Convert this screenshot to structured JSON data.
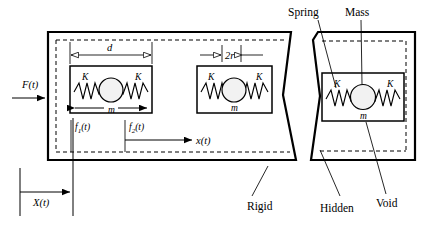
{
  "figure": {
    "kind": "mechanical-metamaterial-unit-cell-diagram",
    "labels": {
      "applied_force": "F(t)",
      "dimension_d": "d",
      "dimension_2r": "2r",
      "spring_constant": "K",
      "mass": "m",
      "internal_force_1": "f",
      "internal_force_1_sub": "1",
      "internal_force_1_tail": "(t)",
      "internal_force_2": "f",
      "internal_force_2_sub": "2",
      "internal_force_2_tail": "(t)",
      "local_displacement": "x(t)",
      "global_displacement": "X(t)",
      "callout_spring": "Spring",
      "callout_mass": "Mass",
      "callout_rigid": "Rigid",
      "callout_hidden": "Hidden",
      "callout_void": "Void"
    },
    "cells": [
      {
        "id": "cell-1",
        "spring_left": "K",
        "spring_right": "K",
        "mass": "m"
      },
      {
        "id": "cell-2",
        "spring_left": "K",
        "spring_right": "K",
        "mass": "m"
      },
      {
        "id": "cell-3",
        "spring_left": "K",
        "spring_right": "K",
        "mass": "m"
      }
    ],
    "colors": {
      "stroke": "#000000",
      "background": "#ffffff",
      "mass_fill": "#f2f2f2"
    }
  }
}
